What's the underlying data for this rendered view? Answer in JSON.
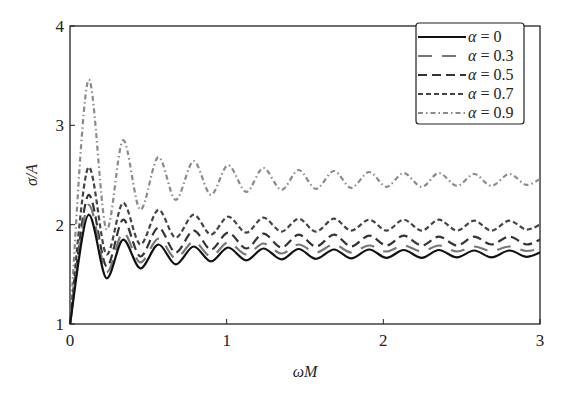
{
  "chart_data": {
    "type": "line",
    "title": "",
    "xlabel": "ωM",
    "ylabel": "σ/A",
    "xlim": [
      0,
      3
    ],
    "ylim": [
      1,
      4
    ],
    "xticks": [
      0,
      1,
      2,
      3
    ],
    "yticks": [
      1,
      2,
      3,
      4
    ],
    "xtick_labels": [
      "0",
      "1",
      "2",
      "3"
    ],
    "ytick_labels": [
      "1",
      "2",
      "3",
      "4"
    ],
    "grid": false,
    "legend_position": "upper right",
    "series": [
      {
        "name": "α = 0",
        "label_symbol": "α",
        "label_value": "= 0",
        "style": "solid",
        "color": "#111111",
        "width": 2.2,
        "x": [
          0,
          0.12,
          0.235,
          0.34,
          0.45,
          0.565,
          0.675,
          0.79,
          0.9,
          1.01,
          1.125,
          1.235,
          1.35,
          1.46,
          1.57,
          1.685,
          1.795,
          1.91,
          2.02,
          2.13,
          2.245,
          2.355,
          2.47,
          2.58,
          2.69,
          2.805,
          2.915,
          3.0
        ],
        "y": [
          1.0,
          2.1,
          1.46,
          1.85,
          1.56,
          1.8,
          1.6,
          1.78,
          1.63,
          1.77,
          1.64,
          1.76,
          1.65,
          1.755,
          1.655,
          1.75,
          1.66,
          1.75,
          1.665,
          1.745,
          1.665,
          1.745,
          1.67,
          1.74,
          1.67,
          1.74,
          1.675,
          1.72
        ]
      },
      {
        "name": "α = 0.3",
        "label_symbol": "α",
        "label_value": "= 0.3",
        "style": "longdash",
        "color": "#777777",
        "width": 2.2,
        "x": [
          0,
          0.12,
          0.235,
          0.34,
          0.45,
          0.565,
          0.675,
          0.79,
          0.9,
          1.01,
          1.125,
          1.235,
          1.35,
          1.46,
          1.57,
          1.685,
          1.795,
          1.91,
          2.02,
          2.13,
          2.245,
          2.355,
          2.47,
          2.58,
          2.69,
          2.805,
          2.915,
          3.0
        ],
        "y": [
          1.0,
          2.2,
          1.52,
          1.92,
          1.62,
          1.86,
          1.66,
          1.83,
          1.68,
          1.82,
          1.7,
          1.81,
          1.71,
          1.8,
          1.72,
          1.8,
          1.72,
          1.79,
          1.73,
          1.79,
          1.73,
          1.79,
          1.73,
          1.78,
          1.735,
          1.78,
          1.735,
          1.76
        ]
      },
      {
        "name": "α = 0.5",
        "label_symbol": "α",
        "label_value": "= 0.5",
        "style": "dashed",
        "color": "#333333",
        "width": 2.2,
        "x": [
          0,
          0.12,
          0.235,
          0.34,
          0.45,
          0.565,
          0.675,
          0.79,
          0.9,
          1.01,
          1.125,
          1.235,
          1.35,
          1.46,
          1.57,
          1.685,
          1.795,
          1.91,
          2.02,
          2.13,
          2.245,
          2.355,
          2.47,
          2.58,
          2.69,
          2.805,
          2.915,
          3.0
        ],
        "y": [
          1.0,
          2.3,
          1.58,
          2.05,
          1.68,
          1.97,
          1.72,
          1.94,
          1.75,
          1.92,
          1.76,
          1.91,
          1.77,
          1.9,
          1.78,
          1.9,
          1.78,
          1.89,
          1.79,
          1.89,
          1.79,
          1.88,
          1.79,
          1.88,
          1.8,
          1.88,
          1.8,
          1.85
        ]
      },
      {
        "name": "α = 0.7",
        "label_symbol": "α",
        "label_value": "= 0.7",
        "style": "shortdash",
        "color": "#444444",
        "width": 2.2,
        "x": [
          0,
          0.12,
          0.235,
          0.34,
          0.45,
          0.565,
          0.675,
          0.79,
          0.9,
          1.01,
          1.125,
          1.235,
          1.35,
          1.46,
          1.57,
          1.685,
          1.795,
          1.91,
          2.02,
          2.13,
          2.245,
          2.355,
          2.47,
          2.58,
          2.69,
          2.805,
          2.915,
          3.0
        ],
        "y": [
          1.0,
          2.58,
          1.7,
          2.22,
          1.8,
          2.15,
          1.87,
          2.1,
          1.9,
          2.08,
          1.92,
          2.07,
          1.93,
          2.06,
          1.93,
          2.06,
          1.94,
          2.05,
          1.94,
          2.05,
          1.94,
          2.05,
          1.94,
          2.04,
          1.94,
          2.04,
          1.95,
          2.0
        ]
      },
      {
        "name": "α = 0.9",
        "label_symbol": "α",
        "label_value": "= 0.9",
        "style": "dashdot",
        "color": "#8a8a8a",
        "width": 2.2,
        "x": [
          0,
          0.12,
          0.235,
          0.34,
          0.45,
          0.565,
          0.675,
          0.79,
          0.9,
          1.01,
          1.125,
          1.235,
          1.35,
          1.46,
          1.57,
          1.685,
          1.795,
          1.91,
          2.02,
          2.13,
          2.245,
          2.355,
          2.47,
          2.58,
          2.69,
          2.805,
          2.915,
          3.0
        ],
        "y": [
          1.0,
          3.46,
          1.95,
          2.85,
          2.15,
          2.68,
          2.25,
          2.64,
          2.3,
          2.6,
          2.33,
          2.57,
          2.35,
          2.55,
          2.36,
          2.54,
          2.37,
          2.53,
          2.38,
          2.52,
          2.38,
          2.52,
          2.39,
          2.51,
          2.39,
          2.51,
          2.4,
          2.46
        ]
      }
    ]
  }
}
